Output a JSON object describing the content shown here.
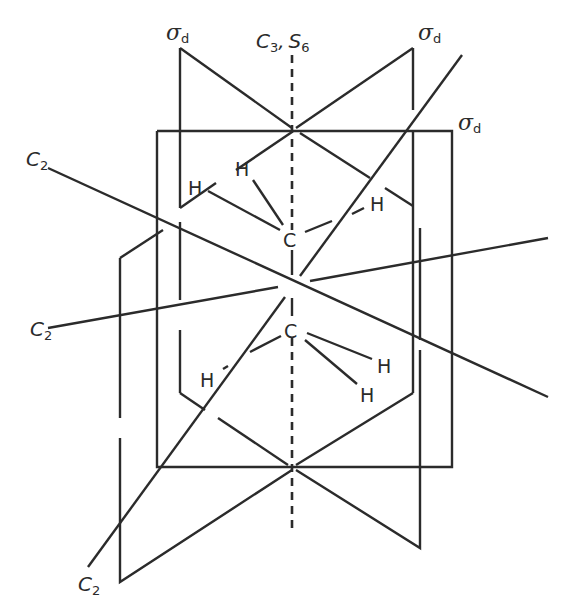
{
  "figure": {
    "stroke_color": "#2b2b2b",
    "background": "#ffffff"
  },
  "labels": {
    "principal_axis": {
      "main": "C",
      "sub": "3",
      "sep": ",",
      "main2": "S",
      "sub2": "6"
    },
    "sigma_d_left": {
      "main": "σ",
      "sub": "d"
    },
    "sigma_d_right": {
      "main": "σ",
      "sub": "d"
    },
    "sigma_d_front": {
      "main": "σ",
      "sub": "d"
    },
    "c2_top_left": {
      "main": "C",
      "sub": "2"
    },
    "c2_mid_left": {
      "main": "C",
      "sub": "2"
    },
    "c2_bottom_left": {
      "main": "C",
      "sub": "2"
    }
  },
  "atoms": {
    "carbon_upper": "C",
    "carbon_lower": "C",
    "h_upper_1": "H",
    "h_upper_2": "H",
    "h_upper_3": "H",
    "h_lower_1": "H",
    "h_lower_2": "H",
    "h_lower_3": "H"
  }
}
